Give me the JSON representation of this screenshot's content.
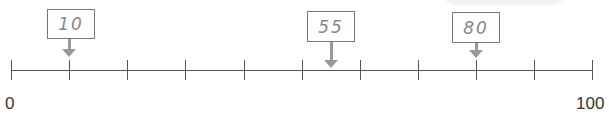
{
  "number_line": {
    "min": 0,
    "max": 100,
    "min_label": "0",
    "max_label": "100",
    "tick_interval": 10,
    "ticks": [
      0,
      10,
      20,
      30,
      40,
      50,
      60,
      70,
      80,
      90,
      100
    ]
  },
  "markers": [
    {
      "label": "10",
      "value": 10
    },
    {
      "label": "55",
      "value": 55
    },
    {
      "label": "80",
      "value": 80
    }
  ],
  "colors": {
    "line": "#555555",
    "arrow": "#999999",
    "box_border": "#777777",
    "handwriting": "#888888"
  }
}
